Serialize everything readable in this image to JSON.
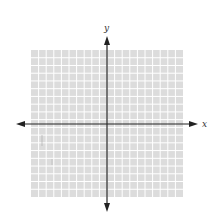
{
  "diagram": {
    "type": "cartesian-coordinate-grid",
    "x_axis_label": "x",
    "y_axis_label": "y",
    "grid": {
      "columns": 20,
      "rows": 19,
      "fill_color": "#dcdcdc",
      "line_color": "#ffffff"
    },
    "axis_color": "#222222"
  }
}
